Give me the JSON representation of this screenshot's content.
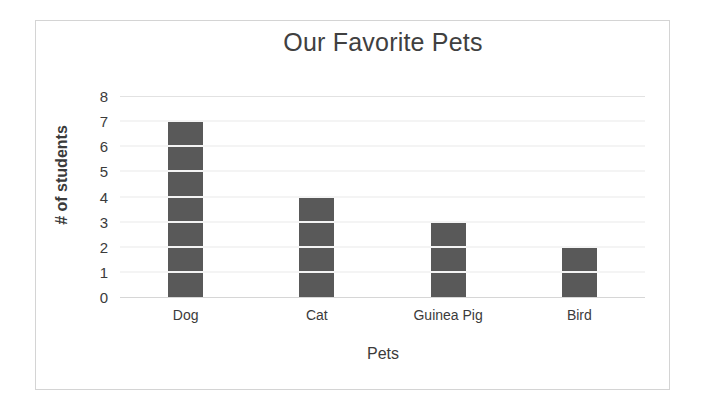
{
  "chart_data": {
    "type": "bar",
    "title": "Our Favorite Pets",
    "xlabel": "Pets",
    "ylabel": "# of students",
    "categories": [
      "Dog",
      "Cat",
      "Guinea Pig",
      "Bird"
    ],
    "values": [
      7,
      4,
      3,
      2
    ],
    "ylim": [
      0,
      8
    ],
    "ytick_labels": [
      "0",
      "1",
      "2",
      "3",
      "4",
      "5",
      "6",
      "7",
      "8"
    ],
    "ytick_values": [
      0,
      1,
      2,
      3,
      4,
      5,
      6,
      7,
      8
    ],
    "grid": true,
    "grid_axis": "y",
    "legend": false,
    "legend_position": "none",
    "bar_color": "#595959",
    "gridline_color": "#e2e2e2",
    "bar_gridline_overlay_color": "#f4f4f4",
    "frame_border_color": "#d4d4d4",
    "background_color": "#ffffff",
    "text_color": "#3b3b3b"
  }
}
